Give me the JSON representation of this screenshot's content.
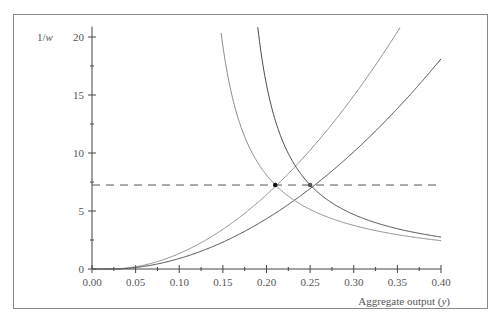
{
  "chart_data": {
    "type": "line",
    "title": "",
    "xlabel": "Aggregate output (y)",
    "ylabel": "1/w",
    "xlim": [
      0,
      0.4
    ],
    "ylim": [
      0,
      20.9
    ],
    "x_ticks": [
      "0.00",
      "0.05",
      "0.10",
      "0.15",
      "0.20",
      "0.25",
      "0.30",
      "0.35",
      "0.40"
    ],
    "x_minor_step": 0.025,
    "y_ticks": [
      "0",
      "5",
      "10",
      "15",
      "20"
    ],
    "y_minor_step": 2.5,
    "grid": false,
    "legend": null,
    "series": [
      {
        "name": "rising-curve-light",
        "form": "a*(y-y0)^p",
        "a": 170,
        "y0": 0.022,
        "p": 1.9,
        "color": "#8c8c8c",
        "points": [
          [
            0.05,
            0.2
          ],
          [
            0.1,
            1.3
          ],
          [
            0.15,
            3.4
          ],
          [
            0.2,
            6.0
          ],
          [
            0.21,
            7.24
          ],
          [
            0.25,
            10.3
          ],
          [
            0.3,
            14.8
          ],
          [
            0.35,
            20.0
          ],
          [
            0.361,
            20.9
          ]
        ]
      },
      {
        "name": "rising-curve-dark",
        "form": "a*(y-y0)^p",
        "a": 115,
        "y0": 0.022,
        "p": 1.9,
        "color": "#4a4a4a",
        "points": [
          [
            0.05,
            0.13
          ],
          [
            0.1,
            0.9
          ],
          [
            0.15,
            2.3
          ],
          [
            0.2,
            4.1
          ],
          [
            0.25,
            7.24
          ],
          [
            0.3,
            10.0
          ],
          [
            0.35,
            13.5
          ],
          [
            0.4,
            18.4
          ]
        ]
      },
      {
        "name": "falling-curve-light",
        "form": "c/(y-y0)",
        "c": 0.7,
        "y0": 0.1136,
        "color": "#8c8c8c",
        "points": [
          [
            0.147,
            20.9
          ],
          [
            0.16,
            15.1
          ],
          [
            0.18,
            10.5
          ],
          [
            0.21,
            7.24
          ],
          [
            0.25,
            5.1
          ],
          [
            0.3,
            3.8
          ],
          [
            0.35,
            3.0
          ],
          [
            0.4,
            2.45
          ]
        ]
      },
      {
        "name": "falling-curve-dark",
        "form": "c/(y-y0)",
        "c": 0.667,
        "y0": 0.158,
        "color": "#4a4a4a",
        "points": [
          [
            0.19,
            20.9
          ],
          [
            0.2,
            15.9
          ],
          [
            0.22,
            10.8
          ],
          [
            0.25,
            7.24
          ],
          [
            0.3,
            4.7
          ],
          [
            0.35,
            3.5
          ],
          [
            0.4,
            2.76
          ]
        ]
      }
    ],
    "reference_line": {
      "type": "horizontal-dashed",
      "value": 7.24,
      "color": "#555555"
    },
    "markers": [
      {
        "x": 0.21,
        "y": 7.24,
        "color": "#111111"
      },
      {
        "x": 0.25,
        "y": 7.24,
        "color": "#555555"
      }
    ]
  },
  "axes": {
    "x_label": "Aggregate output (y)",
    "y_label": "1/w"
  }
}
